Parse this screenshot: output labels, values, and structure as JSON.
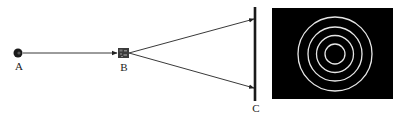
{
  "diagram": {
    "labels": {
      "source": "A",
      "element": "B",
      "screen": "C"
    },
    "colors": {
      "background": "#ffffff",
      "ink": "#222222",
      "pattern_background": "#000000",
      "rings": "#e6e6e6"
    },
    "source": {
      "cx": 18,
      "cy": 53,
      "r": 4.5
    },
    "element": {
      "x": 118,
      "y": 48,
      "w": 11,
      "h": 10
    },
    "screen": {
      "x": 255,
      "y1": 7,
      "y2": 101,
      "width": 2.6
    },
    "beams": [
      {
        "from": [
          23,
          53
        ],
        "to": [
          117,
          53
        ]
      },
      {
        "from": [
          129,
          53
        ],
        "to": [
          254,
          19
        ]
      },
      {
        "from": [
          129,
          53
        ],
        "to": [
          254,
          88
        ]
      }
    ],
    "pattern": {
      "rect": {
        "x": 272,
        "y": 8,
        "w": 121,
        "h": 91
      },
      "center": [
        335,
        54
      ],
      "ring_radii": [
        10,
        18.5,
        27,
        37
      ],
      "ring_width": 1.3
    },
    "label_positions": {
      "source": [
        19,
        62
      ],
      "element": [
        124,
        63
      ],
      "screen": [
        256,
        103
      ]
    }
  }
}
